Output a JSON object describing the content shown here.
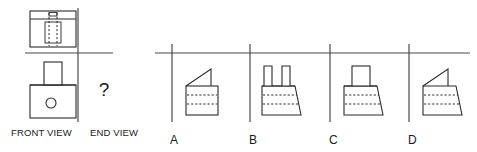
{
  "page": {
    "kind": "orthographic-projection-multiple-choice",
    "width": 477,
    "height": 152,
    "background_color": "#ffffff",
    "line_color": "#2b2b2b",
    "datum_color": "#4a4a4a"
  },
  "given_views": {
    "front_view": {
      "label": "FRONT VIEW",
      "description": "Rectangular base block with a smaller rectangular boss rising from the top centre and a circle on the base face",
      "features": [
        "base-rectangle",
        "top-boss-rectangle",
        "centre-circle"
      ]
    },
    "end_view": {
      "label": "END VIEW",
      "value": "?",
      "description": "Unknown end view to be determined"
    },
    "top_view": {
      "description": "Plan view rectangle with a narrow strip across the top and hidden (dashed) rectangle showing the internal boss",
      "features": [
        "outer-rectangle",
        "top-strip",
        "hidden-rectangle"
      ]
    }
  },
  "question": {
    "prompt_symbol": "?"
  },
  "options": [
    {
      "id": "A",
      "label": "A",
      "description": "Square body with horizontal hidden lines and a triangular wedge on top at the left",
      "body_shape": "rectangle",
      "top_feature": "triangle-wedge-left",
      "hidden_lines": 2
    },
    {
      "id": "B",
      "label": "B",
      "description": "Tapered body sloping to the right with horizontal hidden lines and two vertical prongs on top",
      "body_shape": "tapered-right",
      "top_feature": "two-prongs",
      "hidden_lines": 2
    },
    {
      "id": "C",
      "label": "C",
      "description": "Tapered body sloping to the right with horizontal hidden lines and a rectangular boss on top",
      "body_shape": "tapered-right",
      "top_feature": "rectangle-boss",
      "hidden_lines": 2
    },
    {
      "id": "D",
      "label": "D",
      "description": "Tapered body sloping to the right with horizontal hidden lines and a triangular wedge on top at the left",
      "body_shape": "tapered-right",
      "top_feature": "triangle-wedge-left",
      "hidden_lines": 2
    }
  ]
}
